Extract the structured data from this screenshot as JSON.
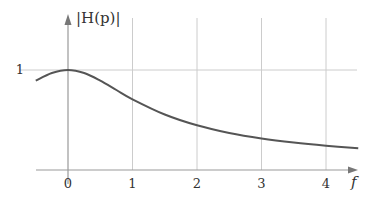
{
  "chart_data": {
    "type": "line",
    "title": "",
    "xlabel": "f",
    "ylabel": "|H(p)|",
    "x_ticks": [
      "0",
      "1",
      "2",
      "3",
      "4"
    ],
    "y_ticks": [
      "1"
    ],
    "xlim": [
      -0.5,
      4.5
    ],
    "ylim": [
      0,
      1.5
    ],
    "grid": true,
    "legend": null,
    "series": [
      {
        "name": "|H(p)|",
        "x": [
          -0.5,
          -0.25,
          0,
          0.25,
          0.5,
          0.75,
          1,
          1.5,
          2,
          2.5,
          3,
          3.5,
          4,
          4.5
        ],
        "y": [
          0.894,
          0.97,
          1.0,
          0.97,
          0.894,
          0.8,
          0.707,
          0.555,
          0.447,
          0.371,
          0.316,
          0.275,
          0.243,
          0.217
        ]
      }
    ],
    "colors": {
      "curve": "#555555",
      "axis": "#999999",
      "grid": "#cccccc"
    }
  }
}
